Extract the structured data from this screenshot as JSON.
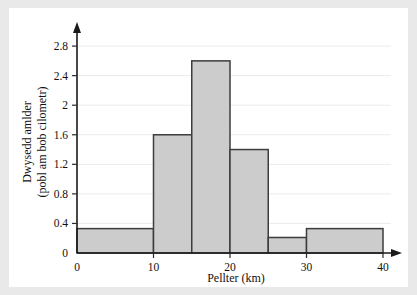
{
  "chart_data": {
    "type": "bar",
    "title": "",
    "subtitle": "",
    "xlabel": "Pellter (km)",
    "ylabel": "Dwysedd amlder",
    "ylabel_line2": "(pobl am bob cilometr)",
    "xlim": [
      0,
      40
    ],
    "ylim": [
      0,
      2.95
    ],
    "grid": true,
    "legend": null,
    "xticks": [
      0,
      10,
      20,
      30,
      40
    ],
    "xtick_labels": [
      "0",
      "10",
      "20",
      "30",
      "40"
    ],
    "yticks": [
      0,
      0.4,
      0.8,
      1.2,
      1.6,
      2,
      2.4,
      2.8
    ],
    "ytick_labels": [
      "0",
      "0.4",
      "0.8",
      "1.2",
      "1.6",
      "2",
      "2.4",
      "2.8"
    ],
    "bin_edges": [
      0,
      10,
      15,
      20,
      25,
      30,
      40
    ],
    "values": [
      0.33,
      1.6,
      2.6,
      1.4,
      0.21,
      0.33
    ],
    "bars": [
      {
        "x0": 0,
        "x1": 10,
        "height": 0.33
      },
      {
        "x0": 10,
        "x1": 15,
        "height": 1.6
      },
      {
        "x0": 15,
        "x1": 20,
        "height": 2.6
      },
      {
        "x0": 20,
        "x1": 25,
        "height": 1.4
      },
      {
        "x0": 25,
        "x1": 30,
        "height": 0.21
      },
      {
        "x0": 30,
        "x1": 40,
        "height": 0.33
      }
    ],
    "bar_fill": "#cccccc",
    "bar_stroke": "#3d3d3d",
    "grid_color": "#ebebeb",
    "axis_color": "#1a1a1a",
    "background": "#ffffff",
    "page_background": "#e9e9e9"
  }
}
